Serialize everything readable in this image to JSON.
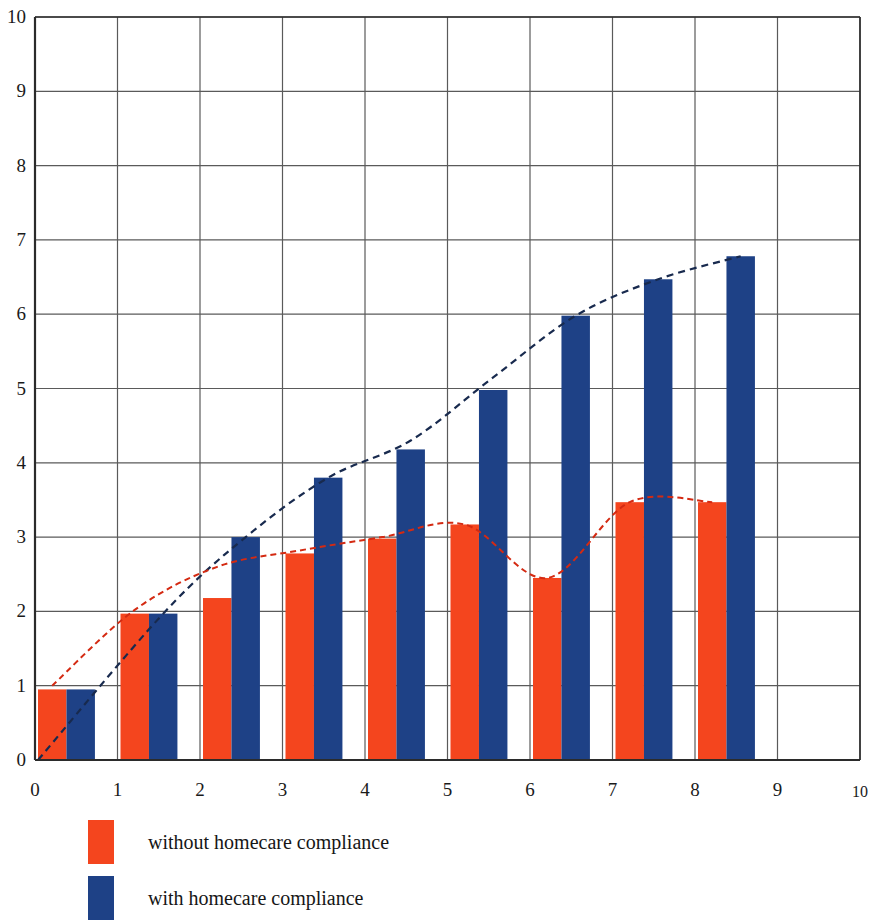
{
  "chart_data": {
    "type": "bar",
    "title": "",
    "xlabel": "",
    "ylabel": "",
    "xlim": [
      0,
      10
    ],
    "ylim": [
      0,
      10
    ],
    "x_ticks": [
      "0",
      "1",
      "2",
      "3",
      "4",
      "5",
      "6",
      "7",
      "8",
      "9",
      "10"
    ],
    "y_ticks": [
      "0",
      "1",
      "2",
      "3",
      "4",
      "5",
      "6",
      "7",
      "8",
      "9",
      "10"
    ],
    "grid": true,
    "legend_position": "bottom-left",
    "categories": [
      "0",
      "1",
      "2",
      "3",
      "4",
      "5",
      "6",
      "7",
      "8"
    ],
    "series": [
      {
        "name": "without homecare compliance",
        "color": "#F4451E",
        "values": [
          0.95,
          1.97,
          2.18,
          2.78,
          2.98,
          3.17,
          2.45,
          3.47,
          3.47
        ]
      },
      {
        "name": "with homecare compliance",
        "color": "#1E4186",
        "values": [
          0.95,
          1.97,
          3.0,
          3.8,
          4.18,
          4.98,
          5.98,
          6.47,
          6.78
        ]
      }
    ],
    "trend_lines": [
      {
        "name": "without homecare compliance trend",
        "color": "#D42A12",
        "style": "dashed",
        "points": [
          [
            0.0,
            1.0
          ],
          [
            1.0,
            2.02
          ],
          [
            2.0,
            2.6
          ],
          [
            3.0,
            2.82
          ],
          [
            4.0,
            3.0
          ],
          [
            5.0,
            3.17
          ],
          [
            6.0,
            2.45
          ],
          [
            7.0,
            3.47
          ],
          [
            8.0,
            3.47
          ]
        ]
      },
      {
        "name": "with homecare compliance trend",
        "color": "#182A4E",
        "style": "dashed",
        "points": [
          [
            0.0,
            0.0
          ],
          [
            1.0,
            1.97
          ],
          [
            2.0,
            3.0
          ],
          [
            3.0,
            3.8
          ],
          [
            4.0,
            4.3
          ],
          [
            5.0,
            5.15
          ],
          [
            6.0,
            5.98
          ],
          [
            7.0,
            6.47
          ],
          [
            8.0,
            6.78
          ]
        ]
      }
    ]
  },
  "legend": {
    "items": [
      {
        "label": "without homecare compliance",
        "color": "#F4451E"
      },
      {
        "label": "with homecare compliance",
        "color": "#1E4186"
      }
    ]
  },
  "colors": {
    "bar_red": "#F4451E",
    "bar_blue": "#1E4186",
    "trend_red": "#D42A12",
    "trend_navy": "#182A4E",
    "grid": "#5a5a5a",
    "axis": "#2b2b2b"
  }
}
